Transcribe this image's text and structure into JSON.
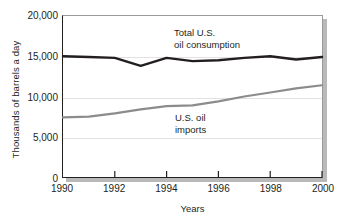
{
  "chart_data": {
    "type": "line",
    "title": "",
    "xlabel": "Years",
    "ylabel": "Thousands of barrels a day",
    "x": [
      1990,
      1991,
      1992,
      1993,
      1994,
      1995,
      1996,
      1997,
      1998,
      1999,
      2000
    ],
    "xlim": [
      1990,
      2000
    ],
    "ylim": [
      0,
      20000
    ],
    "grid": true,
    "legend_position": "inline-annotation",
    "yticks": [
      0,
      5000,
      10000,
      15000,
      20000
    ],
    "yticklabels": [
      "0",
      "5,000",
      "10,000",
      "15,000",
      "20,000"
    ],
    "xticks": [
      1990,
      1992,
      1994,
      1996,
      1998,
      2000
    ],
    "xticklabels": [
      "1990",
      "1992",
      "1994",
      "1996",
      "1998",
      "2000"
    ],
    "series": [
      {
        "name": "Total U.S. oil consumption",
        "label_line1": "Total U.S.",
        "label_line2": "oil consumption",
        "color": "#231f20",
        "width": 2.4,
        "values": [
          15000,
          14900,
          14800,
          13800,
          14800,
          14400,
          14500,
          14800,
          15000,
          14600,
          14900
        ]
      },
      {
        "name": "U.S. oil imports",
        "label_line1": "U.S. oil",
        "label_line2": "imports",
        "color": "#8c8c8c",
        "width": 2.2,
        "values": [
          7400,
          7500,
          7900,
          8400,
          8800,
          8900,
          9400,
          10000,
          10500,
          11000,
          11400
        ]
      }
    ]
  }
}
